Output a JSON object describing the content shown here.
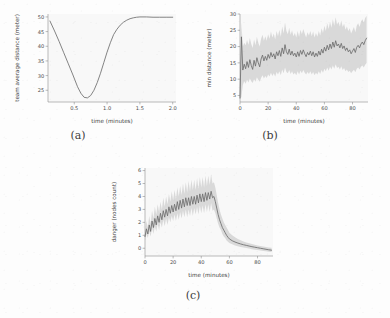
{
  "figure": {
    "background_color": "#fdfdfd",
    "line_color": "#6e6e6e",
    "band_color": "#b4b4b4",
    "axis_color": "#8d8d8d"
  },
  "captions": {
    "a": "(a)",
    "b": "(b)",
    "c": "(c)"
  },
  "chart_data": [
    {
      "panel": "a",
      "type": "line",
      "title": "",
      "xlabel": "time (minutes)",
      "ylabel": "team average distance (meter)",
      "xlim": [
        0.1,
        2.05
      ],
      "ylim": [
        21,
        51
      ],
      "xticks": [
        0.5,
        1.0,
        1.5,
        2.0
      ],
      "xtick_labels": [
        "0.5",
        "1.0",
        "1.5",
        "2.0"
      ],
      "yticks": [
        25,
        30,
        35,
        40,
        45,
        50
      ],
      "ytick_labels": [
        "25",
        "30",
        "35",
        "40",
        "45",
        "50"
      ],
      "grid": false,
      "legend": "none",
      "has_band": false,
      "x": [
        0.13,
        0.2,
        0.27,
        0.34,
        0.41,
        0.48,
        0.55,
        0.6,
        0.65,
        0.7,
        0.75,
        0.8,
        0.85,
        0.9,
        0.95,
        1.0,
        1.05,
        1.1,
        1.15,
        1.2,
        1.25,
        1.3,
        1.35,
        1.4,
        1.45,
        1.5,
        1.6,
        1.7,
        1.8,
        1.9,
        2.0
      ],
      "y": [
        48.6,
        45.2,
        41.6,
        37.8,
        34.0,
        30.2,
        26.2,
        24.0,
        22.6,
        22.4,
        23.2,
        25.0,
        27.6,
        30.8,
        34.4,
        38.0,
        41.2,
        44.0,
        45.8,
        47.2,
        48.2,
        48.9,
        49.4,
        49.7,
        49.9,
        50.0,
        50.0,
        49.9,
        49.9,
        49.9,
        49.9
      ]
    },
    {
      "panel": "b",
      "type": "line",
      "title": "",
      "xlabel": "time (minutes)",
      "ylabel": "min distance (meter)",
      "xlim": [
        0,
        91
      ],
      "ylim": [
        3,
        30
      ],
      "xticks": [
        0,
        20,
        40,
        60,
        80
      ],
      "xtick_labels": [
        "0",
        "20",
        "40",
        "60",
        "80"
      ],
      "yticks": [
        5,
        10,
        15,
        20,
        25,
        30
      ],
      "ytick_labels": [
        "5",
        "10",
        "15",
        "20",
        "25",
        "30"
      ],
      "grid": false,
      "legend": "none",
      "has_band": true,
      "band_description": "shaded standard-deviation envelope around the mean line",
      "x": [
        0,
        1,
        2,
        3,
        4,
        5,
        6,
        7,
        8,
        9,
        10,
        11,
        12,
        13,
        14,
        15,
        16,
        17,
        18,
        19,
        20,
        21,
        22,
        23,
        24,
        25,
        26,
        27,
        28,
        29,
        30,
        31,
        32,
        33,
        34,
        35,
        36,
        37,
        38,
        39,
        40,
        41,
        42,
        43,
        44,
        45,
        46,
        47,
        48,
        49,
        50,
        51,
        52,
        53,
        54,
        55,
        56,
        57,
        58,
        59,
        60,
        61,
        62,
        63,
        64,
        65,
        66,
        67,
        68,
        69,
        70,
        71,
        72,
        73,
        74,
        75,
        76,
        77,
        78,
        79,
        80,
        81,
        82,
        83,
        84,
        85,
        86,
        87,
        88,
        89,
        90
      ],
      "y": [
        4.2,
        23.0,
        12.8,
        14.6,
        13.2,
        15.4,
        13.6,
        16.0,
        14.2,
        13.0,
        15.8,
        14.0,
        16.6,
        15.0,
        13.8,
        16.2,
        17.4,
        15.6,
        17.0,
        15.8,
        17.6,
        16.4,
        18.2,
        16.8,
        17.8,
        16.2,
        18.4,
        17.2,
        18.8,
        17.0,
        19.6,
        17.8,
        20.6,
        18.4,
        17.6,
        19.2,
        17.4,
        18.6,
        17.2,
        18.0,
        16.8,
        18.4,
        17.0,
        18.8,
        17.6,
        19.0,
        17.8,
        16.9,
        18.2,
        17.4,
        18.6,
        17.2,
        18.4,
        16.8,
        18.0,
        17.0,
        18.6,
        17.4,
        19.2,
        18.0,
        19.8,
        18.6,
        20.4,
        19.0,
        20.8,
        19.4,
        21.4,
        19.8,
        21.8,
        20.2,
        20.8,
        19.6,
        21.0,
        19.4,
        20.2,
        18.8,
        19.6,
        18.4,
        19.0,
        17.8,
        18.6,
        19.4,
        18.2,
        19.8,
        20.4,
        19.6,
        20.8,
        21.4,
        20.6,
        21.8,
        22.6
      ],
      "y_lower": [
        4.0,
        4.5,
        8.2,
        9.4,
        8.6,
        9.8,
        9.0,
        10.2,
        9.4,
        8.8,
        10.0,
        9.2,
        10.6,
        9.8,
        9.2,
        10.4,
        11.2,
        10.2,
        11.0,
        10.4,
        11.4,
        10.8,
        12.0,
        11.0,
        11.8,
        10.8,
        12.2,
        11.4,
        12.4,
        11.2,
        13.0,
        11.8,
        13.6,
        12.2,
        11.8,
        12.8,
        11.6,
        12.4,
        11.4,
        12.0,
        11.2,
        12.4,
        11.4,
        12.6,
        11.8,
        12.8,
        12.0,
        11.4,
        12.2,
        11.6,
        12.4,
        11.4,
        12.2,
        11.2,
        12.0,
        11.4,
        12.4,
        11.6,
        12.8,
        12.0,
        13.2,
        12.4,
        13.6,
        12.6,
        13.8,
        13.0,
        14.2,
        13.2,
        14.6,
        13.4,
        13.8,
        13.0,
        14.0,
        12.8,
        13.4,
        12.4,
        13.0,
        12.2,
        12.6,
        11.8,
        12.4,
        12.9,
        12.1,
        13.2,
        13.6,
        13.0,
        13.8,
        14.2,
        13.6,
        14.4,
        15.0
      ],
      "y_upper": [
        4.4,
        27.5,
        20.0,
        21.2,
        20.4,
        22.0,
        20.6,
        22.6,
        20.8,
        19.6,
        22.2,
        20.4,
        23.0,
        21.2,
        20.0,
        22.4,
        23.6,
        21.8,
        23.2,
        21.8,
        23.8,
        22.4,
        24.6,
        22.8,
        24.0,
        22.2,
        24.8,
        23.2,
        25.2,
        23.0,
        26.2,
        24.0,
        27.4,
        24.8,
        23.8,
        25.8,
        23.6,
        25.0,
        23.2,
        24.2,
        22.8,
        24.8,
        23.0,
        25.2,
        23.8,
        25.4,
        24.0,
        22.8,
        24.4,
        23.4,
        24.8,
        23.2,
        24.6,
        22.8,
        24.2,
        23.0,
        24.8,
        23.4,
        25.6,
        24.2,
        26.4,
        24.8,
        27.2,
        25.4,
        27.6,
        25.8,
        28.4,
        26.4,
        29.0,
        26.8,
        27.6,
        26.2,
        28.0,
        26.0,
        27.0,
        25.2,
        26.2,
        24.8,
        25.6,
        24.0,
        25.0,
        26.0,
        24.4,
        26.4,
        27.2,
        26.0,
        27.6,
        28.4,
        27.4,
        28.8,
        29.4
      ]
    },
    {
      "panel": "c",
      "type": "line",
      "title": "",
      "xlabel": "time (minutes)",
      "ylabel": "danger (nodes count)",
      "xlim": [
        0,
        91
      ],
      "ylim": [
        -0.6,
        6.2
      ],
      "xticks": [
        0,
        20,
        40,
        60,
        80
      ],
      "xtick_labels": [
        "0",
        "20",
        "40",
        "60",
        "80"
      ],
      "yticks": [
        0,
        1,
        2,
        3,
        4,
        5,
        6
      ],
      "ytick_labels": [
        "0",
        "1",
        "2",
        "3",
        "4",
        "5",
        "6"
      ],
      "grid": false,
      "legend": "none",
      "has_band": true,
      "band_description": "shaded standard-deviation envelope around the mean line",
      "x": [
        0,
        1,
        2,
        3,
        4,
        5,
        6,
        7,
        8,
        9,
        10,
        11,
        12,
        13,
        14,
        15,
        16,
        17,
        18,
        19,
        20,
        21,
        22,
        23,
        24,
        25,
        26,
        27,
        28,
        29,
        30,
        31,
        32,
        33,
        34,
        35,
        36,
        37,
        38,
        39,
        40,
        41,
        42,
        43,
        44,
        45,
        46,
        47,
        48,
        49,
        50,
        51,
        52,
        53,
        54,
        55,
        56,
        57,
        58,
        59,
        60,
        62,
        64,
        66,
        68,
        70,
        72,
        74,
        76,
        78,
        80,
        82,
        84,
        86,
        88,
        90
      ],
      "y": [
        0.9,
        1.5,
        1.1,
        1.8,
        1.3,
        2.1,
        1.6,
        2.3,
        1.8,
        2.5,
        2.0,
        2.7,
        2.2,
        2.9,
        2.4,
        3.0,
        2.5,
        3.2,
        2.7,
        3.3,
        2.8,
        3.4,
        2.9,
        3.6,
        3.0,
        3.7,
        3.1,
        3.8,
        3.2,
        3.9,
        3.3,
        3.9,
        3.3,
        4.0,
        3.4,
        4.0,
        3.4,
        4.1,
        3.5,
        4.2,
        3.6,
        4.2,
        3.6,
        4.3,
        3.7,
        4.3,
        3.8,
        4.4,
        3.9,
        4.0,
        3.6,
        3.1,
        2.6,
        2.2,
        1.9,
        1.6,
        1.4,
        1.2,
        1.0,
        0.85,
        0.72,
        0.58,
        0.48,
        0.4,
        0.33,
        0.27,
        0.22,
        0.17,
        0.12,
        0.08,
        0.04,
        0.0,
        -0.04,
        -0.08,
        -0.12,
        -0.15
      ],
      "y_lower": [
        0.6,
        1.1,
        0.8,
        1.3,
        0.9,
        1.6,
        1.1,
        1.7,
        1.3,
        1.9,
        1.4,
        2.0,
        1.6,
        2.2,
        1.7,
        2.3,
        1.8,
        2.4,
        2.0,
        2.5,
        2.1,
        2.6,
        2.1,
        2.7,
        2.2,
        2.8,
        2.3,
        2.9,
        2.4,
        3.0,
        2.4,
        3.0,
        2.5,
        3.1,
        2.5,
        3.1,
        2.6,
        3.2,
        2.6,
        3.3,
        2.7,
        3.3,
        2.7,
        3.4,
        2.8,
        3.4,
        2.8,
        3.5,
        2.9,
        3.0,
        2.7,
        2.3,
        1.9,
        1.6,
        1.4,
        1.1,
        0.9,
        0.8,
        0.6,
        0.5,
        0.4,
        0.3,
        0.22,
        0.16,
        0.1,
        0.05,
        0.01,
        -0.03,
        -0.07,
        -0.11,
        -0.14,
        -0.18,
        -0.21,
        -0.24,
        -0.27,
        -0.3
      ],
      "y_upper": [
        1.2,
        2.1,
        1.6,
        2.5,
        1.9,
        2.9,
        2.3,
        3.2,
        2.6,
        3.4,
        2.8,
        3.6,
        3.0,
        3.9,
        3.2,
        4.0,
        3.4,
        4.2,
        3.6,
        4.4,
        3.7,
        4.5,
        3.8,
        4.7,
        4.0,
        4.8,
        4.1,
        5.0,
        4.2,
        5.1,
        4.3,
        5.2,
        4.4,
        5.3,
        4.5,
        5.3,
        4.5,
        5.4,
        4.6,
        5.5,
        4.7,
        5.5,
        4.7,
        5.6,
        4.8,
        5.6,
        4.9,
        5.7,
        5.0,
        5.1,
        4.7,
        4.1,
        3.5,
        3.0,
        2.6,
        2.3,
        2.0,
        1.8,
        1.6,
        1.4,
        1.2,
        1.0,
        0.85,
        0.72,
        0.62,
        0.53,
        0.45,
        0.38,
        0.32,
        0.27,
        0.22,
        0.18,
        0.14,
        0.1,
        0.06,
        0.03
      ]
    }
  ]
}
